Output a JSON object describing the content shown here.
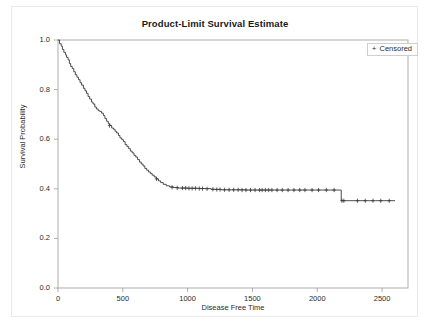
{
  "figure": {
    "title": "Product-Limit Survival Estimate"
  },
  "legend": {
    "marker": "+",
    "label": "Censored"
  },
  "axes": {
    "x": {
      "label": "Disease Free Time",
      "ticks": [
        "0",
        "500",
        "1000",
        "1500",
        "2000",
        "2500"
      ]
    },
    "y": {
      "label": "Survival Probability",
      "ticks": [
        "1.0",
        "0.8",
        "0.6",
        "0.4",
        "0.2",
        "0.0"
      ]
    }
  },
  "chart_data": {
    "type": "line",
    "title": "Product-Limit Survival Estimate",
    "xlabel": "Disease Free Time",
    "ylabel": "Survival Probability",
    "xlim": [
      0,
      2700
    ],
    "ylim": [
      0.0,
      1.0
    ],
    "xticks": [
      0,
      500,
      1000,
      1500,
      2000,
      2500
    ],
    "yticks": [
      0.0,
      0.2,
      0.4,
      0.6,
      0.8,
      1.0
    ],
    "grid": false,
    "legend_position": "top-right",
    "series": [
      {
        "name": "Survival",
        "style": "step-post",
        "color": "#3a3a3a",
        "points": [
          [
            0,
            1.0
          ],
          [
            12,
            0.985
          ],
          [
            25,
            0.975
          ],
          [
            34,
            0.962
          ],
          [
            45,
            0.95
          ],
          [
            58,
            0.94
          ],
          [
            66,
            0.93
          ],
          [
            78,
            0.92
          ],
          [
            88,
            0.905
          ],
          [
            98,
            0.893
          ],
          [
            110,
            0.885
          ],
          [
            122,
            0.872
          ],
          [
            134,
            0.86
          ],
          [
            146,
            0.85
          ],
          [
            158,
            0.84
          ],
          [
            170,
            0.828
          ],
          [
            182,
            0.818
          ],
          [
            196,
            0.805
          ],
          [
            208,
            0.795
          ],
          [
            220,
            0.785
          ],
          [
            232,
            0.772
          ],
          [
            244,
            0.762
          ],
          [
            258,
            0.75
          ],
          [
            270,
            0.742
          ],
          [
            284,
            0.73
          ],
          [
            296,
            0.722
          ],
          [
            310,
            0.715
          ],
          [
            322,
            0.712
          ],
          [
            336,
            0.705
          ],
          [
            350,
            0.695
          ],
          [
            362,
            0.683
          ],
          [
            375,
            0.672
          ],
          [
            388,
            0.662
          ],
          [
            400,
            0.655
          ],
          [
            414,
            0.645
          ],
          [
            428,
            0.64
          ],
          [
            440,
            0.632
          ],
          [
            452,
            0.625
          ],
          [
            466,
            0.615
          ],
          [
            478,
            0.605
          ],
          [
            492,
            0.598
          ],
          [
            505,
            0.59
          ],
          [
            518,
            0.578
          ],
          [
            532,
            0.57
          ],
          [
            545,
            0.562
          ],
          [
            558,
            0.552
          ],
          [
            572,
            0.545
          ],
          [
            586,
            0.535
          ],
          [
            600,
            0.528
          ],
          [
            614,
            0.518
          ],
          [
            628,
            0.508
          ],
          [
            642,
            0.5
          ],
          [
            656,
            0.492
          ],
          [
            670,
            0.482
          ],
          [
            684,
            0.475
          ],
          [
            698,
            0.468
          ],
          [
            712,
            0.462
          ],
          [
            726,
            0.455
          ],
          [
            742,
            0.448
          ],
          [
            758,
            0.44
          ],
          [
            775,
            0.432
          ],
          [
            792,
            0.425
          ],
          [
            812,
            0.418
          ],
          [
            835,
            0.412
          ],
          [
            860,
            0.408
          ],
          [
            890,
            0.405
          ],
          [
            930,
            0.403
          ],
          [
            1000,
            0.402
          ],
          [
            1100,
            0.401
          ],
          [
            1180,
            0.398
          ],
          [
            1260,
            0.396
          ],
          [
            1340,
            0.396
          ],
          [
            1450,
            0.395
          ],
          [
            1600,
            0.395
          ],
          [
            1800,
            0.395
          ],
          [
            2000,
            0.395
          ],
          [
            2180,
            0.395
          ],
          [
            2185,
            0.352
          ],
          [
            2300,
            0.352
          ],
          [
            2450,
            0.352
          ],
          [
            2600,
            0.352
          ]
        ]
      }
    ],
    "censored": {
      "marker": "+",
      "label": "Censored",
      "points": [
        [
          398,
          0.655
        ],
        [
          760,
          0.44
        ],
        [
          880,
          0.406
        ],
        [
          920,
          0.404
        ],
        [
          960,
          0.403
        ],
        [
          985,
          0.403
        ],
        [
          1010,
          0.402
        ],
        [
          1035,
          0.402
        ],
        [
          1060,
          0.402
        ],
        [
          1090,
          0.401
        ],
        [
          1115,
          0.401
        ],
        [
          1150,
          0.4
        ],
        [
          1195,
          0.398
        ],
        [
          1225,
          0.397
        ],
        [
          1250,
          0.397
        ],
        [
          1285,
          0.396
        ],
        [
          1320,
          0.396
        ],
        [
          1355,
          0.396
        ],
        [
          1390,
          0.396
        ],
        [
          1420,
          0.395
        ],
        [
          1450,
          0.395
        ],
        [
          1485,
          0.395
        ],
        [
          1520,
          0.395
        ],
        [
          1555,
          0.395
        ],
        [
          1575,
          0.395
        ],
        [
          1600,
          0.395
        ],
        [
          1625,
          0.395
        ],
        [
          1650,
          0.395
        ],
        [
          1690,
          0.395
        ],
        [
          1730,
          0.395
        ],
        [
          1775,
          0.395
        ],
        [
          1820,
          0.395
        ],
        [
          1865,
          0.395
        ],
        [
          1905,
          0.395
        ],
        [
          1960,
          0.395
        ],
        [
          2010,
          0.395
        ],
        [
          2070,
          0.395
        ],
        [
          2130,
          0.395
        ],
        [
          2190,
          0.352
        ],
        [
          2205,
          0.352
        ],
        [
          2310,
          0.352
        ],
        [
          2370,
          0.352
        ],
        [
          2430,
          0.352
        ],
        [
          2490,
          0.352
        ],
        [
          2555,
          0.352
        ]
      ]
    }
  }
}
